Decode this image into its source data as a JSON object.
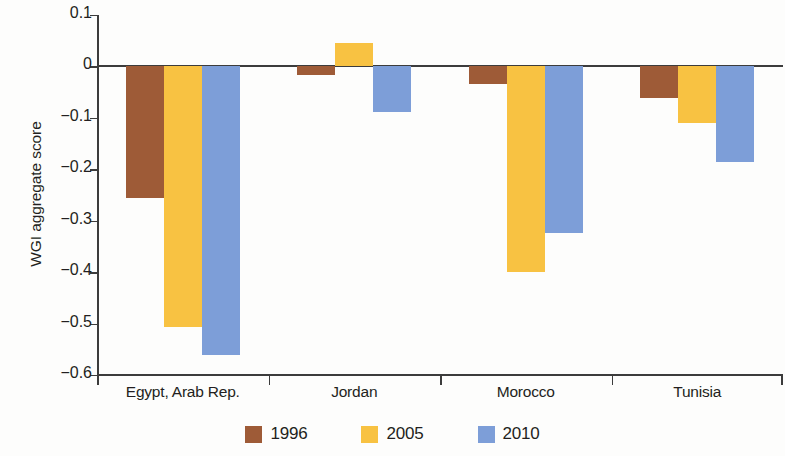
{
  "chart_data": {
    "type": "bar",
    "title": "",
    "subtitle": "",
    "xlabel": "",
    "ylabel": "WGI aggregate score",
    "categories": [
      "Egypt, Arab Rep.",
      "Jordan",
      "Morocco",
      "Tunisia"
    ],
    "series": [
      {
        "name": "1996",
        "color": "#9e5b37",
        "values": [
          -0.256,
          -0.017,
          -0.035,
          -0.062
        ]
      },
      {
        "name": "2005",
        "color": "#f8c242",
        "values": [
          -0.507,
          0.045,
          -0.4,
          -0.11
        ]
      },
      {
        "name": "2010",
        "color": "#7d9ed8",
        "values": [
          -0.561,
          -0.089,
          -0.324,
          -0.185
        ]
      }
    ],
    "ylim": [
      -0.6,
      0.1
    ],
    "yticks": [
      0.1,
      0,
      -0.1,
      -0.2,
      -0.3,
      -0.4,
      -0.5,
      -0.6
    ],
    "ytick_labels": [
      "0.1",
      "0",
      "−0.1",
      "−0.2",
      "−0.3",
      "−0.4",
      "−0.5",
      "−0.6"
    ],
    "grid": false,
    "legend_position": "bottom",
    "axis_color": "#3c3c3c"
  },
  "legend": {
    "items": [
      {
        "label": "1996",
        "color": "#9e5b37"
      },
      {
        "label": "2005",
        "color": "#f8c242"
      },
      {
        "label": "2010",
        "color": "#7d9ed8"
      }
    ]
  }
}
